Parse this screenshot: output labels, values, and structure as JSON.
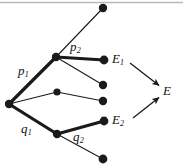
{
  "figure": {
    "kind": "probability-tree-diagram",
    "background_color": "#ffffff",
    "stroke_color": "#1a1a1a",
    "top_rule_color": "#b9b9b9",
    "width": 183,
    "height": 167
  },
  "nodes": [
    {
      "id": "root",
      "name": "root-node",
      "cx": 9,
      "cy": 104,
      "r": 4.2
    },
    {
      "id": "n-up",
      "name": "upper-branch-node",
      "cx": 56,
      "cy": 57,
      "r": 4.2
    },
    {
      "id": "n-mid",
      "name": "middle-branch-node",
      "cx": 57,
      "cy": 92,
      "r": 3.6
    },
    {
      "id": "n-low",
      "name": "lower-branch-node",
      "cx": 57,
      "cy": 134,
      "r": 4.2
    },
    {
      "id": "leaf-1",
      "name": "leaf-node-top",
      "cx": 103,
      "cy": 8,
      "r": 4.2
    },
    {
      "id": "leaf-2",
      "name": "leaf-node-e1",
      "cx": 104,
      "cy": 60,
      "r": 4.4
    },
    {
      "id": "leaf-3",
      "name": "leaf-node-upper-mid",
      "cx": 103,
      "cy": 85,
      "r": 4.2
    },
    {
      "id": "leaf-4",
      "name": "leaf-node-lower-mid",
      "cx": 103,
      "cy": 101,
      "r": 4.2
    },
    {
      "id": "leaf-5",
      "name": "leaf-node-e2",
      "cx": 104,
      "cy": 121,
      "r": 4.4
    },
    {
      "id": "leaf-6",
      "name": "leaf-node-bottom",
      "cx": 103,
      "cy": 159,
      "r": 4.4
    }
  ],
  "edges": [
    {
      "id": "e-root-up",
      "name": "edge-root-to-upper",
      "from": "root",
      "to": "n-up",
      "weight": "bold",
      "width": 3.2
    },
    {
      "id": "e-root-mid",
      "name": "edge-root-to-middle",
      "from": "root",
      "to": "n-mid",
      "weight": "thin",
      "width": 1.1
    },
    {
      "id": "e-root-low",
      "name": "edge-root-to-lower",
      "from": "root",
      "to": "n-low",
      "weight": "bold",
      "width": 3.2
    },
    {
      "id": "e-up-leaf1",
      "name": "edge-upper-to-leaf-top",
      "from": "n-up",
      "to": "leaf-1",
      "weight": "thin",
      "width": 1.1
    },
    {
      "id": "e-up-e1",
      "name": "edge-upper-to-e1",
      "from": "n-up",
      "to": "leaf-2",
      "weight": "bold",
      "width": 3.2
    },
    {
      "id": "e-up-leaf3",
      "name": "edge-upper-to-leaf-mid",
      "from": "n-up",
      "to": "leaf-3",
      "weight": "thin",
      "width": 1.1
    },
    {
      "id": "e-mid-leaf4",
      "name": "edge-middle-to-leaf",
      "from": "n-mid",
      "to": "leaf-4",
      "weight": "thin",
      "width": 1.1
    },
    {
      "id": "e-low-e2",
      "name": "edge-lower-to-e2",
      "from": "n-low",
      "to": "leaf-5",
      "weight": "bold",
      "width": 3.2
    },
    {
      "id": "e-low-leaf6",
      "name": "edge-lower-to-leaf-bottom",
      "from": "n-low",
      "to": "leaf-6",
      "weight": "thin",
      "width": 1.1
    }
  ],
  "arrows": [
    {
      "id": "a-e1-e",
      "name": "arrow-e1-to-e",
      "x1": 130,
      "y1": 63,
      "x2": 160,
      "y2": 86,
      "width": 1.3
    },
    {
      "id": "a-e2-e",
      "name": "arrow-e2-to-e",
      "x1": 133,
      "y1": 118,
      "x2": 160,
      "y2": 97,
      "width": 1.3
    }
  ],
  "labels": {
    "p1": {
      "base": "p",
      "sub": "1",
      "x": 18,
      "y": 64
    },
    "p2": {
      "base": "p",
      "sub": "2",
      "x": 70,
      "y": 40
    },
    "q1": {
      "base": "q",
      "sub": "1",
      "x": 21,
      "y": 122
    },
    "q2": {
      "base": "q",
      "sub": "2",
      "x": 73,
      "y": 130
    },
    "e1": {
      "base": "E",
      "sub": "1",
      "x": 112,
      "y": 52
    },
    "e2": {
      "base": "E",
      "sub": "2",
      "x": 112,
      "y": 113
    },
    "e_total": {
      "base": "E",
      "sub": "",
      "x": 163,
      "y": 84
    }
  }
}
